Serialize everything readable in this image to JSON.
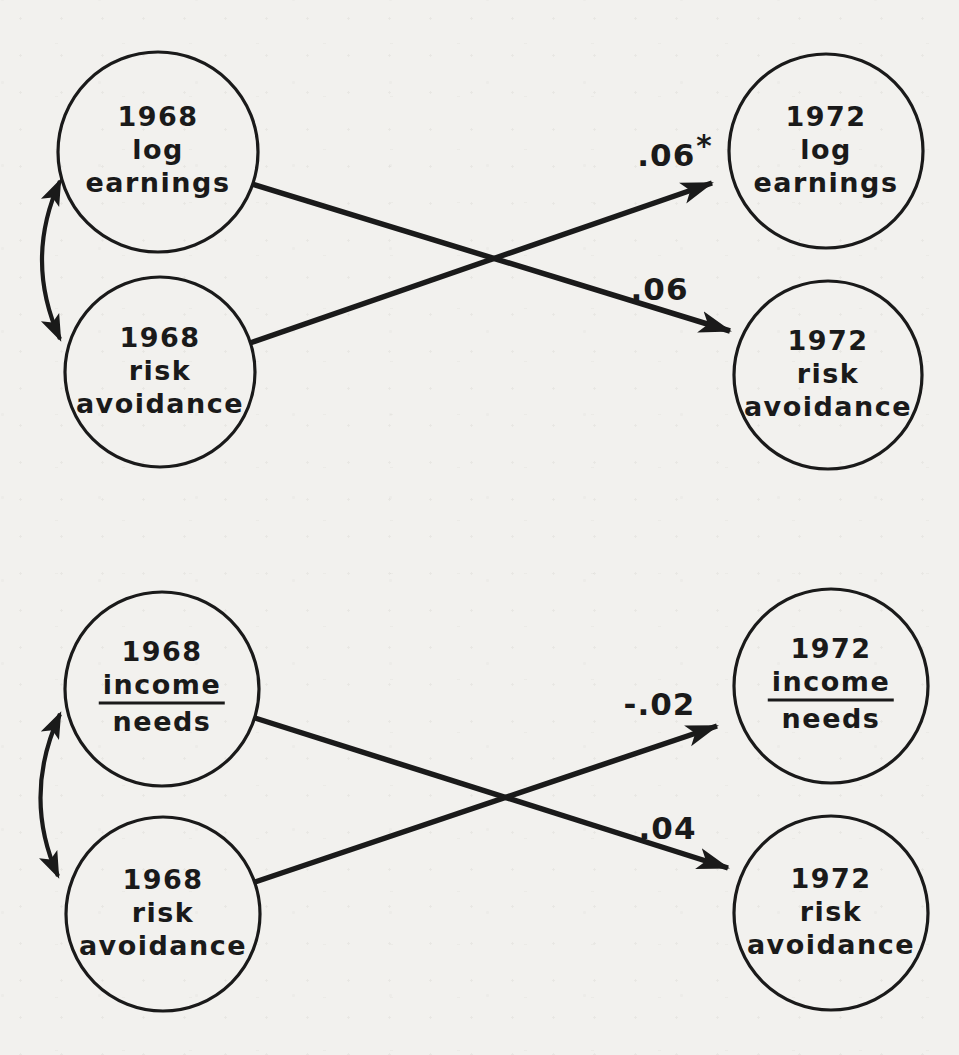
{
  "colors": {
    "ink": "#1a1a1a",
    "paper": "#f2f1ee"
  },
  "figure": {
    "type": "cross-lagged-panel-path-diagram",
    "panels": [
      {
        "id": "log-earnings-panel",
        "nodes": {
          "left_top": {
            "lines": [
              "1968",
              "log",
              "earnings"
            ]
          },
          "left_bottom": {
            "lines": [
              "1968",
              "risk",
              "avoidance"
            ]
          },
          "right_top": {
            "lines": [
              "1972",
              "log",
              "earnings"
            ]
          },
          "right_bottom": {
            "lines": [
              "1972",
              "risk",
              "avoidance"
            ]
          }
        },
        "coefficients": {
          "cross_up": {
            "value": ".06",
            "superscript": "*",
            "from": "1968 risk avoidance",
            "to": "1972 log earnings"
          },
          "cross_down": {
            "value": ".06",
            "superscript": "",
            "from": "1968 log earnings",
            "to": "1972 risk avoidance"
          }
        },
        "correlation_arrow": {
          "between": [
            "1968 log earnings",
            "1968 risk avoidance"
          ],
          "style": "curved-double-headed"
        }
      },
      {
        "id": "income-needs-panel",
        "nodes": {
          "left_top": {
            "lines": [
              "1968",
              "income",
              "needs"
            ],
            "fraction": true
          },
          "left_bottom": {
            "lines": [
              "1968",
              "risk",
              "avoidance"
            ]
          },
          "right_top": {
            "lines": [
              "1972",
              "income",
              "needs"
            ],
            "fraction": true
          },
          "right_bottom": {
            "lines": [
              "1972",
              "risk",
              "avoidance"
            ]
          }
        },
        "coefficients": {
          "cross_up": {
            "value": "-.02",
            "superscript": "",
            "from": "1968 risk avoidance",
            "to": "1972 income/needs"
          },
          "cross_down": {
            "value": ".04",
            "superscript": "",
            "from": "1968 income/needs",
            "to": "1972 risk avoidance"
          }
        },
        "correlation_arrow": {
          "between": [
            "1968 income/needs",
            "1968 risk avoidance"
          ],
          "style": "curved-double-headed"
        }
      }
    ]
  }
}
